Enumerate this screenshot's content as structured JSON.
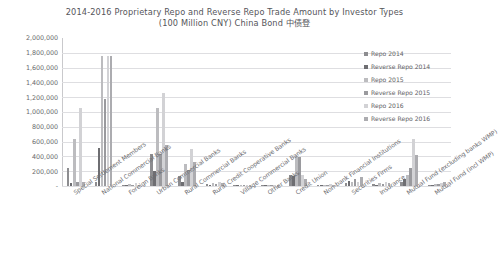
{
  "chart": {
    "title_line1": "2014-2016 Proprietary Repo and Reverse Repo Trade Amount by Investor Types",
    "title_line2": "(100 Million CNY) China Bond 中债登"
  },
  "chart_data": {
    "type": "bar",
    "title": "2014-2016 Proprietary Repo and Reverse Repo Trade Amount by Investor Types (100 Million CNY) China Bond 中债登",
    "xlabel": "",
    "ylabel": "",
    "ylim": [
      0,
      2000000
    ],
    "grid": true,
    "legend_position": "right",
    "ytick_labels": [
      "2,000,000",
      "1,800,000",
      "1,600,000",
      "1,400,000",
      "1,200,000",
      "1,000,000",
      "800,000",
      "600,000",
      "400,000",
      "200,000",
      "-"
    ],
    "ytick_values": [
      2000000,
      1800000,
      1600000,
      1400000,
      1200000,
      1000000,
      800000,
      600000,
      400000,
      200000,
      0
    ],
    "categories": [
      "Special Settlement Members",
      "National Commercial Banks",
      "Foreign Banks",
      "Urban Commercial Banks",
      "Rural Commercial Banks",
      "Rural Credit Cooperative Banks",
      "Village Commercial Banks",
      "Other Banks",
      "Credit Union",
      "Non-bank Financial Institutions",
      "Securities Firms",
      "Insurance",
      "Mutual Fund (excluding banks WMP)",
      "Mutual Fund (incl WMP)"
    ],
    "series": [
      {
        "name": "Repo 2014",
        "color": "#8d8d90",
        "values": [
          250000,
          60000,
          15000,
          430000,
          130000,
          25000,
          2000,
          4000,
          150000,
          12000,
          40000,
          30000,
          60000,
          12000
        ]
      },
      {
        "name": "Reverse Repo 2014",
        "color": "#6e6e72",
        "values": [
          40000,
          520000,
          8000,
          205000,
          60000,
          10000,
          1500,
          3000,
          130000,
          6000,
          70000,
          18000,
          95000,
          18000
        ]
      },
      {
        "name": "Repo 2015",
        "color": "#bcbcbf",
        "values": [
          640000,
          1760000,
          22000,
          1060000,
          300000,
          40000,
          3000,
          7000,
          400000,
          16000,
          50000,
          45000,
          150000,
          22000
        ]
      },
      {
        "name": "Reverse Repo 2015",
        "color": "#9a9a9e",
        "values": [
          60000,
          1170000,
          13000,
          430000,
          210000,
          28000,
          2500,
          5000,
          390000,
          9000,
          95000,
          30000,
          240000,
          30000
        ]
      },
      {
        "name": "Repo 2016",
        "color": "#d2d2d5",
        "values": [
          1060000,
          1760000,
          35000,
          1260000,
          500000,
          60000,
          5000,
          9000,
          150000,
          22000,
          60000,
          60000,
          640000,
          35000
        ]
      },
      {
        "name": "Reverse Repo 2016",
        "color": "#acacb0",
        "values": [
          60000,
          1760000,
          20000,
          560000,
          330000,
          45000,
          4000,
          6000,
          100000,
          13000,
          120000,
          45000,
          420000,
          55000
        ]
      }
    ]
  },
  "legend": {
    "items": [
      {
        "label": "Repo 2014"
      },
      {
        "label": "Reverse Repo 2014"
      },
      {
        "label": "Repo 2015"
      },
      {
        "label": "Reverse Repo 2015"
      },
      {
        "label": "Repo 2016"
      },
      {
        "label": "Reverse Repo 2016"
      }
    ]
  }
}
